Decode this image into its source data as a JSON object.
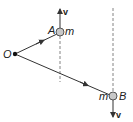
{
  "diagram": {
    "pivot": {
      "label": "O",
      "x": 15,
      "y": 54
    },
    "mass_a": {
      "label": "A",
      "mass_label": "m",
      "x": 60,
      "y": 32,
      "velocity_label": "v",
      "velocity_direction": "up"
    },
    "mass_b": {
      "label": "B",
      "mass_label": "m",
      "x": 113,
      "y": 96,
      "velocity_label": "v",
      "velocity_direction": "down"
    },
    "colors": {
      "line": "#333333",
      "ball_fill": "#c8c8c8",
      "ball_stroke": "#555555",
      "dashed": "#666666"
    }
  }
}
